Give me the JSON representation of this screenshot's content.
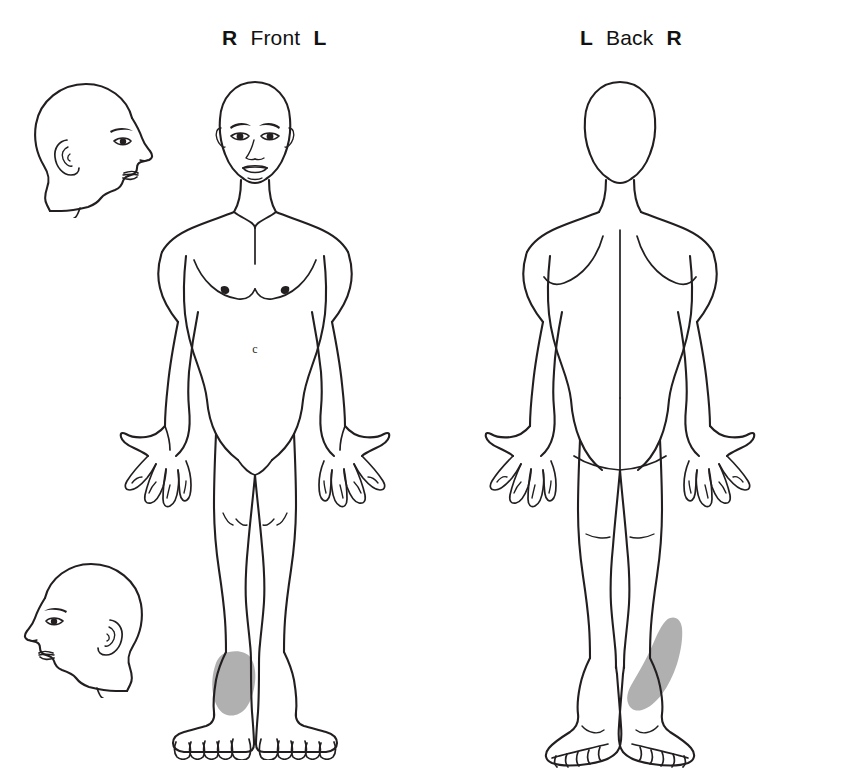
{
  "chart": {
    "background_color": "#ffffff",
    "ink_color": "#231f20",
    "pain_shade_color": "#b0b0b0"
  },
  "front_view": {
    "left_label": "R",
    "view_label": "Front",
    "right_label": "L"
  },
  "back_view": {
    "left_label": "L",
    "view_label": "Back",
    "right_label": "R"
  },
  "head_profiles": [
    {
      "name": "head-profile-right-facing",
      "facing": "right"
    },
    {
      "name": "head-profile-left-facing",
      "facing": "left"
    }
  ],
  "pain_regions": [
    {
      "id": "front-right-foot-dorsum",
      "view": "Front",
      "side": "R",
      "body_part": "foot dorsum / ankle",
      "shade": "#b0b0b0"
    },
    {
      "id": "back-right-achilles-heel",
      "view": "Back",
      "side": "R",
      "body_part": "achilles tendon / lower calf / heel",
      "shade": "#b0b0b0"
    }
  ]
}
